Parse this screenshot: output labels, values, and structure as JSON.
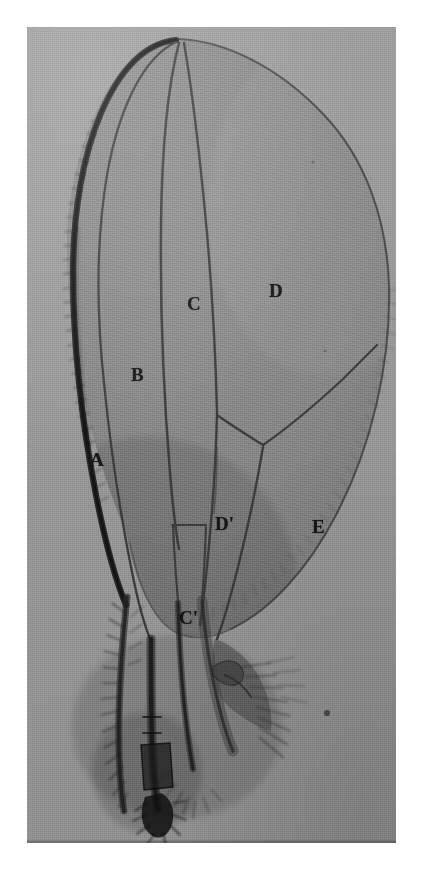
{
  "figure": {
    "kind": "photomicrograph-plate",
    "plate_background_hex": "#9a9a9a",
    "membrane_hex": "#8a8a8a",
    "vein_hex": "#3a3a3a",
    "costa_hex": "#1e1e1e",
    "label_hex": "#121212"
  },
  "labels": [
    {
      "id": "A",
      "text": "A",
      "name": "cell-label-a",
      "note": "cell between costa and first long vein"
    },
    {
      "id": "B",
      "text": "B",
      "name": "cell-label-b",
      "note": "second cell from anterior margin"
    },
    {
      "id": "C",
      "text": "C",
      "name": "cell-label-c",
      "note": "third cell, apex of wing"
    },
    {
      "id": "Cp",
      "text": "C'",
      "name": "cell-label-c-prime",
      "note": "small basal cell below C"
    },
    {
      "id": "D",
      "text": "D",
      "name": "cell-label-d",
      "note": "large posterior-apical cell"
    },
    {
      "id": "Dp",
      "text": "D'",
      "name": "cell-label-d-prime",
      "note": "small cell basal to D"
    },
    {
      "id": "E",
      "text": "E",
      "name": "cell-label-e",
      "note": "large posterior cell"
    }
  ],
  "margins": {
    "top_white_px": 27,
    "left_white_px": 27,
    "right_white_px": 25,
    "bottom_white_px": 26
  }
}
